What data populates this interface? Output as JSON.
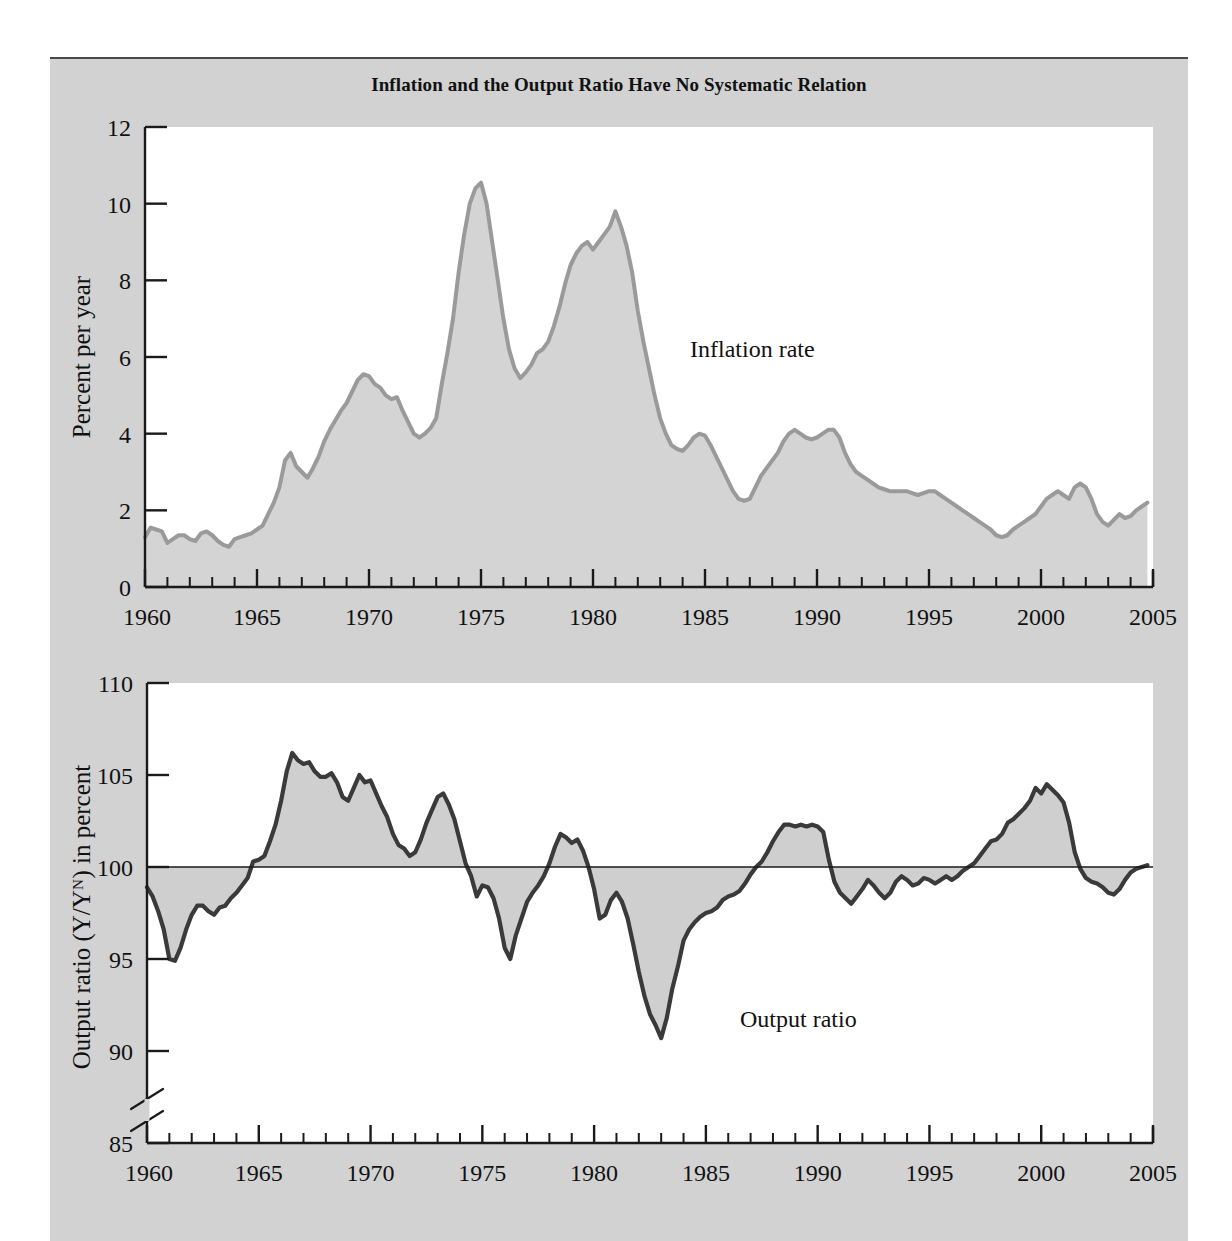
{
  "figure": {
    "title": "Inflation and the Output Ratio Have No Systematic Relation",
    "background_color": "#d2d2d2",
    "plot_background_color": "#ffffff"
  },
  "panels": [
    {
      "id": "inflation",
      "ylabel": "Percent per year",
      "series_label": "Inflation rate",
      "ytick_labels": [
        "0",
        "2",
        "4",
        "6",
        "8",
        "10",
        "12"
      ],
      "xtick_labels": [
        "1960",
        "1965",
        "1970",
        "1975",
        "1980",
        "1985",
        "1990",
        "1995",
        "2000",
        "2005"
      ]
    },
    {
      "id": "output-ratio",
      "ylabel": "Output ratio (Y/Yᴺ) in percent",
      "series_label": "Output ratio",
      "ytick_labels": [
        "85",
        "90",
        "95",
        "100",
        "105",
        "110"
      ],
      "xtick_labels": [
        "1960",
        "1965",
        "1970",
        "1975",
        "1980",
        "1985",
        "1990",
        "1995",
        "2000",
        "2005"
      ],
      "has_axis_break": true
    }
  ],
  "chart_data": [
    {
      "type": "area",
      "title": "Inflation and the Output Ratio Have No Systematic Relation",
      "name": "Inflation rate",
      "xlabel": "",
      "ylabel": "Percent per year",
      "xlim": [
        1960,
        2005
      ],
      "ylim": [
        0,
        12
      ],
      "yticks": [
        0,
        2,
        4,
        6,
        8,
        10,
        12
      ],
      "xticks": [
        1960,
        1965,
        1970,
        1975,
        1980,
        1985,
        1990,
        1995,
        2000,
        2005
      ],
      "xtick_minor_interval": 1,
      "grid": false,
      "legend": "inline annotation at 1982, 8.6",
      "fill_color": "#d4d4d4",
      "line_color": "#9a9a9a",
      "x": [
        1960.0,
        1960.25,
        1960.5,
        1960.75,
        1961.0,
        1961.25,
        1961.5,
        1961.75,
        1962.0,
        1962.25,
        1962.5,
        1962.75,
        1963.0,
        1963.25,
        1963.5,
        1963.75,
        1964.0,
        1964.25,
        1964.5,
        1964.75,
        1965.0,
        1965.25,
        1965.5,
        1965.75,
        1966.0,
        1966.25,
        1966.5,
        1966.75,
        1967.0,
        1967.25,
        1967.5,
        1967.75,
        1968.0,
        1968.25,
        1968.5,
        1968.75,
        1969.0,
        1969.25,
        1969.5,
        1969.75,
        1970.0,
        1970.25,
        1970.5,
        1970.75,
        1971.0,
        1971.25,
        1971.5,
        1971.75,
        1972.0,
        1972.25,
        1972.5,
        1972.75,
        1973.0,
        1973.25,
        1973.5,
        1973.75,
        1974.0,
        1974.25,
        1974.5,
        1974.75,
        1975.0,
        1975.25,
        1975.5,
        1975.75,
        1976.0,
        1976.25,
        1976.5,
        1976.75,
        1977.0,
        1977.25,
        1977.5,
        1977.75,
        1978.0,
        1978.25,
        1978.5,
        1978.75,
        1979.0,
        1979.25,
        1979.5,
        1979.75,
        1980.0,
        1980.25,
        1980.5,
        1980.75,
        1981.0,
        1981.25,
        1981.5,
        1981.75,
        1982.0,
        1982.25,
        1982.5,
        1982.75,
        1983.0,
        1983.25,
        1983.5,
        1983.75,
        1984.0,
        1984.25,
        1984.5,
        1984.75,
        1985.0,
        1985.25,
        1985.5,
        1985.75,
        1986.0,
        1986.25,
        1986.5,
        1986.75,
        1987.0,
        1987.25,
        1987.5,
        1987.75,
        1988.0,
        1988.25,
        1988.5,
        1988.75,
        1989.0,
        1989.25,
        1989.5,
        1989.75,
        1990.0,
        1990.25,
        1990.5,
        1990.75,
        1991.0,
        1991.25,
        1991.5,
        1991.75,
        1992.0,
        1992.25,
        1992.5,
        1992.75,
        1993.0,
        1993.25,
        1993.5,
        1993.75,
        1994.0,
        1994.25,
        1994.5,
        1994.75,
        1995.0,
        1995.25,
        1995.5,
        1995.75,
        1996.0,
        1996.25,
        1996.5,
        1996.75,
        1997.0,
        1997.25,
        1997.5,
        1997.75,
        1998.0,
        1998.25,
        1998.5,
        1998.75,
        1999.0,
        1999.25,
        1999.5,
        1999.75,
        2000.0,
        2000.25,
        2000.5,
        2000.75,
        2001.0,
        2001.25,
        2001.5,
        2001.75,
        2002.0,
        2002.25,
        2002.5,
        2002.75,
        2003.0,
        2003.25,
        2003.5,
        2003.75,
        2004.0,
        2004.25,
        2004.5,
        2004.75
      ],
      "y": [
        1.3,
        1.55,
        1.5,
        1.45,
        1.15,
        1.25,
        1.35,
        1.35,
        1.25,
        1.2,
        1.4,
        1.45,
        1.35,
        1.2,
        1.1,
        1.05,
        1.25,
        1.3,
        1.35,
        1.4,
        1.5,
        1.6,
        1.9,
        2.2,
        2.6,
        3.3,
        3.5,
        3.15,
        3.0,
        2.85,
        3.1,
        3.4,
        3.8,
        4.1,
        4.35,
        4.6,
        4.8,
        5.1,
        5.4,
        5.55,
        5.5,
        5.3,
        5.2,
        5.0,
        4.9,
        4.95,
        4.6,
        4.3,
        4.0,
        3.9,
        4.0,
        4.15,
        4.4,
        5.3,
        6.1,
        7.0,
        8.2,
        9.2,
        10.0,
        10.4,
        10.55,
        10.0,
        9.0,
        8.0,
        7.0,
        6.2,
        5.7,
        5.45,
        5.6,
        5.8,
        6.1,
        6.2,
        6.4,
        6.8,
        7.3,
        7.9,
        8.4,
        8.7,
        8.9,
        9.0,
        8.8,
        9.0,
        9.2,
        9.4,
        9.8,
        9.4,
        8.9,
        8.2,
        7.2,
        6.4,
        5.7,
        5.0,
        4.4,
        4.0,
        3.7,
        3.6,
        3.55,
        3.7,
        3.9,
        4.0,
        3.95,
        3.7,
        3.4,
        3.1,
        2.8,
        2.5,
        2.3,
        2.25,
        2.3,
        2.6,
        2.9,
        3.1,
        3.3,
        3.5,
        3.8,
        4.0,
        4.1,
        4.0,
        3.9,
        3.85,
        3.9,
        4.0,
        4.1,
        4.1,
        3.9,
        3.5,
        3.2,
        3.0,
        2.9,
        2.8,
        2.7,
        2.6,
        2.55,
        2.5,
        2.5,
        2.5,
        2.5,
        2.45,
        2.4,
        2.45,
        2.5,
        2.5,
        2.4,
        2.3,
        2.2,
        2.1,
        2.0,
        1.9,
        1.8,
        1.7,
        1.6,
        1.5,
        1.35,
        1.3,
        1.35,
        1.5,
        1.6,
        1.7,
        1.8,
        1.9,
        2.1,
        2.3,
        2.4,
        2.5,
        2.4,
        2.3,
        2.6,
        2.7,
        2.6,
        2.3,
        1.9,
        1.7,
        1.6,
        1.75,
        1.9,
        1.8,
        1.85,
        2.0,
        2.1,
        2.2,
        2.3,
        2.4,
        2.5
      ]
    },
    {
      "type": "area",
      "name": "Output ratio",
      "xlabel": "",
      "ylabel": "Output ratio (Y/Yᴺ) in percent",
      "xlim": [
        1960,
        2005
      ],
      "ylim": [
        85,
        110
      ],
      "yticks": [
        85,
        90,
        95,
        100,
        105,
        110
      ],
      "xticks": [
        1960,
        1965,
        1970,
        1975,
        1980,
        1985,
        1990,
        1995,
        2000,
        2005
      ],
      "xtick_minor_interval": 1,
      "baseline": 100,
      "grid": false,
      "legend": "inline annotation at 1984, 91.5",
      "fill_color": "#cfcfcf",
      "line_color": "#3a3a3a",
      "x": [
        1960.0,
        1960.25,
        1960.5,
        1960.75,
        1961.0,
        1961.25,
        1961.5,
        1961.75,
        1962.0,
        1962.25,
        1962.5,
        1962.75,
        1963.0,
        1963.25,
        1963.5,
        1963.75,
        1964.0,
        1964.25,
        1964.5,
        1964.75,
        1965.0,
        1965.25,
        1965.5,
        1965.75,
        1966.0,
        1966.25,
        1966.5,
        1966.75,
        1967.0,
        1967.25,
        1967.5,
        1967.75,
        1968.0,
        1968.25,
        1968.5,
        1968.75,
        1969.0,
        1969.25,
        1969.5,
        1969.75,
        1970.0,
        1970.25,
        1970.5,
        1970.75,
        1971.0,
        1971.25,
        1971.5,
        1971.75,
        1972.0,
        1972.25,
        1972.5,
        1972.75,
        1973.0,
        1973.25,
        1973.5,
        1973.75,
        1974.0,
        1974.25,
        1974.5,
        1974.75,
        1975.0,
        1975.25,
        1975.5,
        1975.75,
        1976.0,
        1976.25,
        1976.5,
        1976.75,
        1977.0,
        1977.25,
        1977.5,
        1977.75,
        1978.0,
        1978.25,
        1978.5,
        1978.75,
        1979.0,
        1979.25,
        1979.5,
        1979.75,
        1980.0,
        1980.25,
        1980.5,
        1980.75,
        1981.0,
        1981.25,
        1981.5,
        1981.75,
        1982.0,
        1982.25,
        1982.5,
        1982.75,
        1983.0,
        1983.25,
        1983.5,
        1983.75,
        1984.0,
        1984.25,
        1984.5,
        1984.75,
        1985.0,
        1985.25,
        1985.5,
        1985.75,
        1986.0,
        1986.25,
        1986.5,
        1986.75,
        1987.0,
        1987.25,
        1987.5,
        1987.75,
        1988.0,
        1988.25,
        1988.5,
        1988.75,
        1989.0,
        1989.25,
        1989.5,
        1989.75,
        1990.0,
        1990.25,
        1990.5,
        1990.75,
        1991.0,
        1991.25,
        1991.5,
        1991.75,
        1992.0,
        1992.25,
        1992.5,
        1992.75,
        1993.0,
        1993.25,
        1993.5,
        1993.75,
        1994.0,
        1994.25,
        1994.5,
        1994.75,
        1995.0,
        1995.25,
        1995.5,
        1995.75,
        1996.0,
        1996.25,
        1996.5,
        1996.75,
        1997.0,
        1997.25,
        1997.5,
        1997.75,
        1998.0,
        1998.25,
        1998.5,
        1998.75,
        1999.0,
        1999.25,
        1999.5,
        1999.75,
        2000.0,
        2000.25,
        2000.5,
        2000.75,
        2001.0,
        2001.25,
        2001.5,
        2001.75,
        2002.0,
        2002.25,
        2002.5,
        2002.75,
        2003.0,
        2003.25,
        2003.5,
        2003.75,
        2004.0,
        2004.25,
        2004.5,
        2004.75
      ],
      "y": [
        98.9,
        98.4,
        97.6,
        96.6,
        95.0,
        94.9,
        95.6,
        96.6,
        97.4,
        97.9,
        97.9,
        97.6,
        97.4,
        97.8,
        97.9,
        98.3,
        98.6,
        99.0,
        99.4,
        100.3,
        100.4,
        100.6,
        101.4,
        102.3,
        103.6,
        105.2,
        106.2,
        105.8,
        105.6,
        105.7,
        105.2,
        104.9,
        104.9,
        105.1,
        104.6,
        103.8,
        103.6,
        104.3,
        105.0,
        104.6,
        104.7,
        104.0,
        103.3,
        102.7,
        101.8,
        101.2,
        101.0,
        100.6,
        100.8,
        101.5,
        102.4,
        103.1,
        103.8,
        104.0,
        103.4,
        102.6,
        101.4,
        100.2,
        99.5,
        98.4,
        99.0,
        98.9,
        98.3,
        97.2,
        95.6,
        95.0,
        96.3,
        97.2,
        98.1,
        98.6,
        99.0,
        99.5,
        100.2,
        101.1,
        101.8,
        101.6,
        101.3,
        101.5,
        100.9,
        100.0,
        98.8,
        97.2,
        97.4,
        98.2,
        98.6,
        98.1,
        97.2,
        95.8,
        94.3,
        93.0,
        92.0,
        91.4,
        90.7,
        91.8,
        93.4,
        94.6,
        96.0,
        96.6,
        97.0,
        97.3,
        97.5,
        97.6,
        97.8,
        98.2,
        98.4,
        98.5,
        98.7,
        99.1,
        99.6,
        100.0,
        100.3,
        100.8,
        101.4,
        101.9,
        102.3,
        102.3,
        102.2,
        102.3,
        102.2,
        102.3,
        102.2,
        101.9,
        100.4,
        99.2,
        98.6,
        98.3,
        98.0,
        98.4,
        98.8,
        99.3,
        99.0,
        98.6,
        98.3,
        98.6,
        99.2,
        99.5,
        99.3,
        99.0,
        99.1,
        99.4,
        99.3,
        99.1,
        99.3,
        99.5,
        99.3,
        99.5,
        99.8,
        100.0,
        100.2,
        100.6,
        101.0,
        101.4,
        101.5,
        101.8,
        102.4,
        102.6,
        102.9,
        103.2,
        103.6,
        104.3,
        104.0,
        104.5,
        104.2,
        103.9,
        103.5,
        102.4,
        100.8,
        99.9,
        99.4,
        99.2,
        99.1,
        98.9,
        98.6,
        98.5,
        98.8,
        99.3,
        99.7,
        99.9,
        100.0,
        100.1,
        100.1
      ]
    }
  ]
}
